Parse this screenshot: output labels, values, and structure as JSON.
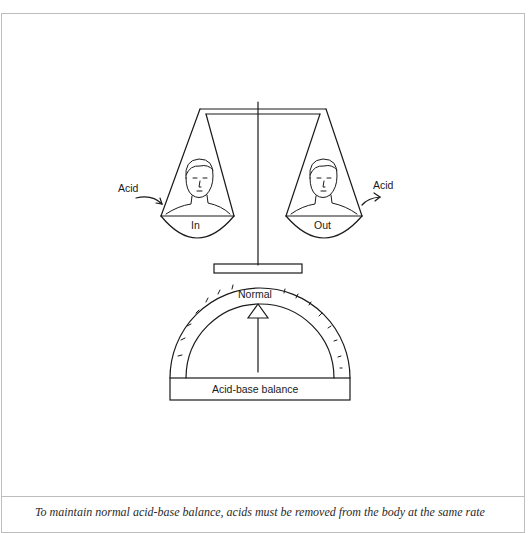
{
  "figure": {
    "title": "Acid-base balance",
    "left_pan": {
      "label": "In",
      "arrow_label": "Acid",
      "arrow_direction": "in"
    },
    "right_pan": {
      "label": "Out",
      "arrow_label": "Acid",
      "arrow_direction": "out"
    },
    "gauge": {
      "pointer_label": "Normal",
      "base_label": "Acid-base balance",
      "tick_count": 16
    },
    "colors": {
      "line": "#1a1a1a",
      "frame": "#bdbdbd",
      "background": "#ffffff"
    }
  },
  "caption": {
    "text": "To maintain normal acid-base balance, acids must be removed from the body at the same rate"
  }
}
